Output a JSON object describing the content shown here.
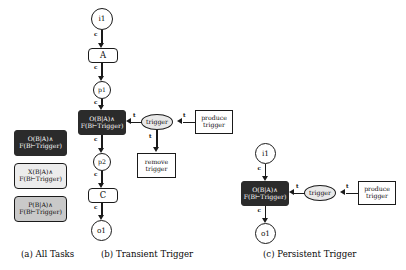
{
  "figure": {
    "panels": [
      {
        "id": "a",
        "caption": "(a) All Tasks",
        "legend": [
          {
            "key": "obligation",
            "line1": "O(B|A)∧",
            "line2": "F(B⊢Trigger)",
            "fill": "#2b2b2b",
            "text_color": "#ffffff"
          },
          {
            "key": "exclusion",
            "line1": "X(B|A)∧",
            "line2": "F(B⊢Trigger)",
            "fill": "#ececec",
            "text_color": "#0a0a0a"
          },
          {
            "key": "permission",
            "line1": "P(B|A)∧",
            "line2": "F(B⊢Trigger)",
            "fill": "#c9c9c9",
            "text_color": "#0a0a0a"
          }
        ]
      },
      {
        "id": "b",
        "caption": "(b) Transient Trigger",
        "nodes": {
          "input": "i1",
          "task_a": "A",
          "place_p1": "p1",
          "main_line1": "O(B|A)∧",
          "main_line2": "F(B⊢Trigger)",
          "place_p2": "p2",
          "task_c": "C",
          "output": "o1",
          "trigger": "trigger",
          "produce_line1": "produce",
          "produce_line2": "trigger",
          "remove_line1": "remove",
          "remove_line2": "trigger"
        },
        "edge_labels": {
          "c": "c",
          "t": "t"
        }
      },
      {
        "id": "c",
        "caption": "(c) Persistent Trigger",
        "nodes": {
          "input": "i1",
          "main_line1": "O(B|A)∧",
          "main_line2": "F(B⊢Trigger)",
          "output": "o1",
          "trigger": "trigger",
          "produce_line1": "produce",
          "produce_line2": "trigger"
        },
        "edge_labels": {
          "c": "c",
          "t": "t"
        }
      }
    ],
    "colors": {
      "dark_task": "#2b2b2b",
      "light_task": "#ececec",
      "mid_task": "#c9c9c9",
      "trigger_fill": "#e9e9e9",
      "stroke": "#1a1a1a",
      "background": "#ffffff"
    }
  }
}
